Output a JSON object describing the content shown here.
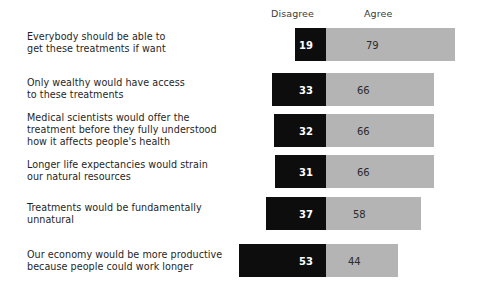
{
  "header": {
    "disagree_label": "Disagree",
    "agree_label": "Agree"
  },
  "chart_data": {
    "type": "bar",
    "subtype": "diverging-stacked-bar",
    "title": "",
    "subtitle": "",
    "xlabel": "",
    "ylabel": "",
    "grid": false,
    "legend_position": "top",
    "legend": [
      "Disagree",
      "Agree"
    ],
    "center_value": 0,
    "axis_note": "bars centered on the Disagree/Agree boundary; Disagree extends left, Agree extends right",
    "units": "percent",
    "categories": [
      "Everybody should be able to\nget these treatments if want",
      "Only wealthy would have access\nto these treatments",
      "Medical scientists would offer the\ntreatment before they fully understood\nhow it affects people's health",
      "Longer life expectancies would strain\nour natural resources",
      "Treatments would be fundamentally\nunnatural",
      "Our economy would be more productive\nbecause people could work longer"
    ],
    "series": [
      {
        "name": "Disagree",
        "color": "#0d0d0d",
        "direction": "left",
        "values": [
          19,
          33,
          32,
          31,
          37,
          53
        ]
      },
      {
        "name": "Agree",
        "color": "#b4b4b4",
        "direction": "right",
        "values": [
          79,
          66,
          66,
          66,
          58,
          44
        ]
      }
    ],
    "rows": [
      {
        "label": "Everybody should be able to\nget these treatments if want",
        "disagree": 19,
        "agree": 79,
        "disagree_text": "19",
        "agree_text": "79"
      },
      {
        "label": "Only wealthy would have access\nto these treatments",
        "disagree": 33,
        "agree": 66,
        "disagree_text": "33",
        "agree_text": "66"
      },
      {
        "label": "Medical scientists would offer the\ntreatment before they fully understood\nhow it affects people's health",
        "disagree": 32,
        "agree": 66,
        "disagree_text": "32",
        "agree_text": "66"
      },
      {
        "label": "Longer life expectancies would strain\nour natural resources",
        "disagree": 31,
        "agree": 66,
        "disagree_text": "31",
        "agree_text": "66"
      },
      {
        "label": "Treatments would be fundamentally\nunnatural",
        "disagree": 37,
        "agree": 58,
        "disagree_text": "37",
        "agree_text": "58"
      },
      {
        "label": "Our economy would be more productive\nbecause people could work longer",
        "disagree": 53,
        "agree": 44,
        "disagree_text": "53",
        "agree_text": "44"
      }
    ]
  },
  "layout": {
    "center_x_px": 326,
    "px_per_unit": 1.635,
    "bar_tops_px": [
      28,
      73,
      114,
      155,
      197,
      244
    ],
    "bar_height_px": 33,
    "label_tops_px": [
      31,
      77,
      112,
      159,
      202,
      249
    ],
    "agree_value_offsets_px": [
      40,
      31,
      31,
      31,
      27,
      22
    ]
  }
}
